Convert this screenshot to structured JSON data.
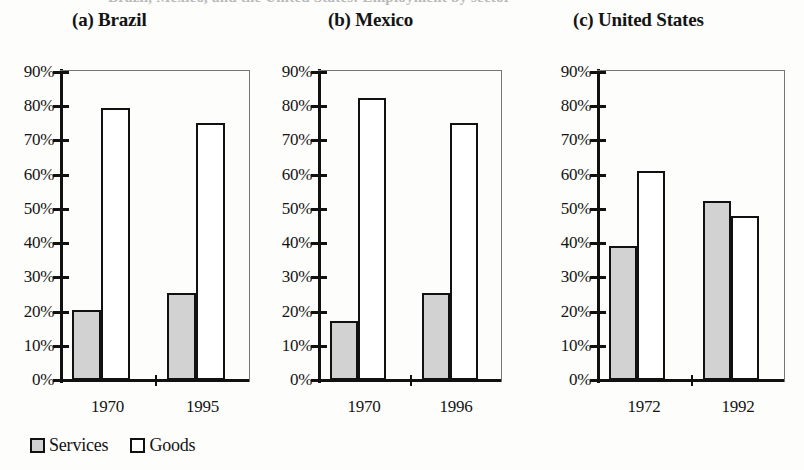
{
  "page": {
    "cut_caption": "Brazil, Mexico, and the United States: Employment by sector"
  },
  "legend": {
    "items": [
      {
        "label": "Services",
        "swatch": "services-swatch",
        "color": "#d2d2d2"
      },
      {
        "label": "Goods",
        "swatch": "goods-swatch",
        "color": "#ffffff"
      }
    ]
  },
  "axis": {
    "tick_labels": [
      "90%",
      "80%",
      "70%",
      "60%",
      "50%",
      "40%",
      "30%",
      "20%",
      "10%",
      "0%"
    ],
    "min": 0,
    "max": 90
  },
  "panels": [
    {
      "title": "(a) Brazil",
      "categories": [
        "1970",
        "1995"
      ],
      "series": [
        {
          "name": "Services",
          "values": [
            20.5,
            25.5
          ]
        },
        {
          "name": "Goods",
          "values": [
            79.5,
            75.0
          ]
        }
      ]
    },
    {
      "title": "(b) Mexico",
      "categories": [
        "1970",
        "1996"
      ],
      "series": [
        {
          "name": "Services",
          "values": [
            17.3,
            25.3
          ]
        },
        {
          "name": "Goods",
          "values": [
            82.5,
            75.0
          ]
        }
      ]
    },
    {
      "title": "(c) United States",
      "categories": [
        "1972",
        "1992"
      ],
      "series": [
        {
          "name": "Services",
          "values": [
            39.3,
            52.3
          ]
        },
        {
          "name": "Goods",
          "values": [
            61.0,
            48.0
          ]
        }
      ]
    }
  ],
  "chart_data": {
    "type": "bar",
    "title": "Brazil, Mexico, and the United States: Employment by sector",
    "xlabel": "",
    "ylabel": "",
    "ylim": [
      0,
      90
    ],
    "ytick_labels": [
      "0%",
      "10%",
      "20%",
      "30%",
      "40%",
      "50%",
      "60%",
      "70%",
      "80%",
      "90%"
    ],
    "grid": false,
    "legend_position": "bottom-left",
    "legend_entries": [
      "Services",
      "Goods"
    ],
    "panels": [
      {
        "panel_label": "(a) Brazil",
        "categories": [
          "1970",
          "1995"
        ],
        "series": [
          {
            "name": "Services",
            "values": [
              20.5,
              25.5
            ]
          },
          {
            "name": "Goods",
            "values": [
              79.5,
              75.0
            ]
          }
        ]
      },
      {
        "panel_label": "(b) Mexico",
        "categories": [
          "1970",
          "1996"
        ],
        "series": [
          {
            "name": "Services",
            "values": [
              17.3,
              25.3
            ]
          },
          {
            "name": "Goods",
            "values": [
              82.5,
              75.0
            ]
          }
        ]
      },
      {
        "panel_label": "(c) United States",
        "categories": [
          "1972",
          "1992"
        ],
        "series": [
          {
            "name": "Services",
            "values": [
              39.3,
              52.3
            ]
          },
          {
            "name": "Goods",
            "values": [
              61.0,
              48.0
            ]
          }
        ]
      }
    ]
  },
  "layout": {
    "panel_geometry": [
      {
        "title_left": 72,
        "chart_left": 60,
        "chart_width": 190,
        "ylabels_left": 0
      },
      {
        "title_left": 328,
        "chart_left": 318,
        "chart_width": 184,
        "ylabels_left": 258
      },
      {
        "title_left": 573,
        "chart_left": 597,
        "chart_width": 188,
        "ylabels_left": 537
      }
    ]
  }
}
